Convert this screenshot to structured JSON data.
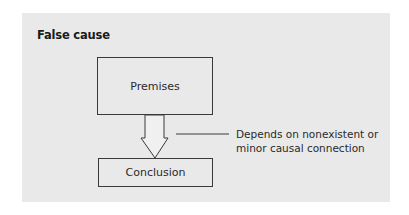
{
  "diagram": {
    "title": "False cause",
    "nodes": {
      "premises": "Premises",
      "conclusion": "Conclusion"
    },
    "annotation": {
      "line1": "Depends on nonexistent or",
      "line2": "minor causal connection"
    },
    "colors": {
      "panel_background": "#e9e9e9",
      "stroke": "#3a3a3a",
      "text": "#2a2a2a"
    }
  }
}
